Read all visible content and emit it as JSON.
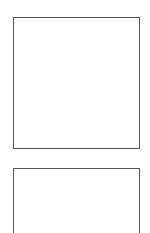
{
  "panels": [
    {
      "content": ""
    },
    {
      "content": ""
    }
  ],
  "colors": {
    "background": "#ffffff",
    "border": "#555555"
  }
}
